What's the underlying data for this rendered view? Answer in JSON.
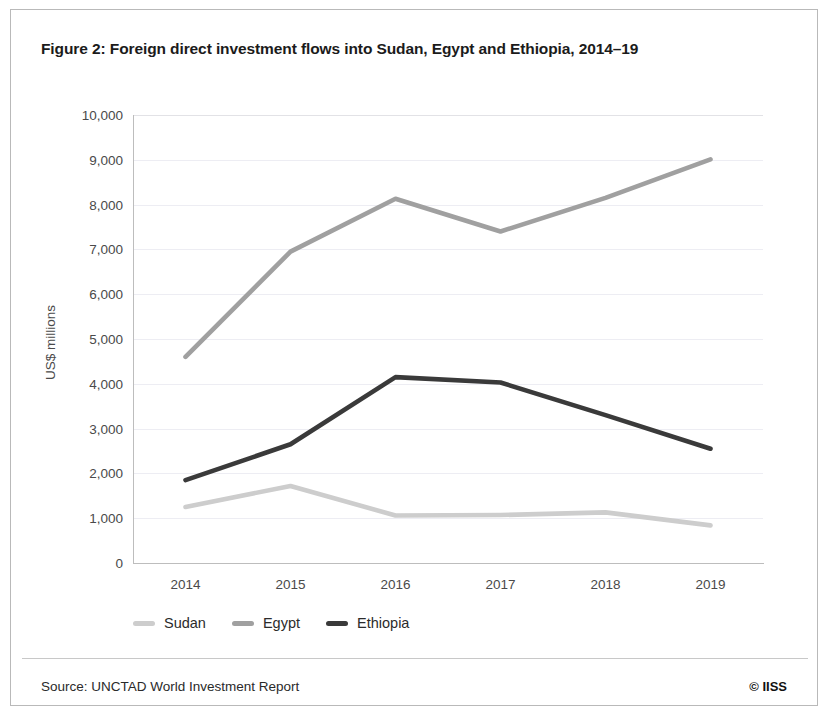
{
  "figure": {
    "title": "Figure 2: Foreign direct investment flows into Sudan, Egypt and Ethiopia, 2014–19",
    "source": "Source: UNCTAD World Investment Report",
    "credit": "© IISS"
  },
  "chart_data": {
    "type": "line",
    "title": "Figure 2: Foreign direct investment flows into Sudan, Egypt and Ethiopia, 2014–19",
    "xlabel": "",
    "ylabel": "US$ millions",
    "categories": [
      "2014",
      "2015",
      "2016",
      "2017",
      "2018",
      "2019"
    ],
    "x_tick_labels": [
      "2014",
      "2015",
      "2016",
      "2017",
      "2018",
      "2019"
    ],
    "y_tick_labels": [
      "0",
      "1,000",
      "2,000",
      "3,000",
      "4,000",
      "5,000",
      "6,000",
      "7,000",
      "8,000",
      "9,000",
      "10,000"
    ],
    "y_ticks": [
      0,
      1000,
      2000,
      3000,
      4000,
      5000,
      6000,
      7000,
      8000,
      9000,
      10000
    ],
    "ylim": [
      0,
      10000
    ],
    "grid": true,
    "legend_position": "bottom-left",
    "series": [
      {
        "name": "Sudan",
        "color": "#cdcdcd",
        "values": [
          1250,
          1720,
          1060,
          1070,
          1130,
          840
        ]
      },
      {
        "name": "Egypt",
        "color": "#a0a0a0",
        "values": [
          4600,
          6950,
          8130,
          7400,
          8150,
          9010
        ]
      },
      {
        "name": "Ethiopia",
        "color": "#3a3a3a",
        "values": [
          1850,
          2650,
          4150,
          4030,
          3300,
          2550
        ]
      }
    ]
  }
}
